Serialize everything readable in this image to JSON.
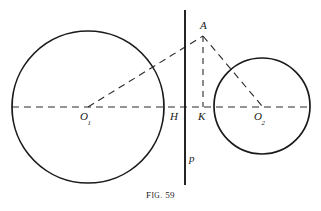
{
  "figure": {
    "caption_prefix": "F",
    "caption_smallcaps": "IG.",
    "caption_number": "59",
    "caption_full": "Fig. 59",
    "background_color": "#ffffff",
    "ink_color": "#1a1a1a"
  },
  "labels": {
    "point_a": "A",
    "point_h": "H",
    "point_k": "K",
    "center_left_base": "O",
    "center_left_sub": "1",
    "center_right_base": "O",
    "center_right_sub": "2",
    "line_p": "p"
  },
  "geometry": {
    "canvas": {
      "width": 321,
      "height": 211
    },
    "circle_left": {
      "cx": 88,
      "cy": 107,
      "r": 76,
      "stroke": "#1a1a1a",
      "stroke_width": 1.6
    },
    "circle_right": {
      "cx": 262,
      "cy": 106,
      "r": 48,
      "stroke": "#1a1a1a",
      "stroke_width": 1.6
    },
    "axis_horizontal": {
      "x1": 12,
      "y1": 107,
      "x2": 311,
      "y2": 107,
      "dash": "7,5"
    },
    "line_p": {
      "x1": 185,
      "y1": 10,
      "x2": 185,
      "y2": 185,
      "stroke_width": 1.8
    },
    "point_a": {
      "x": 203,
      "y": 36
    },
    "point_h": {
      "x": 185,
      "y": 107
    },
    "point_k": {
      "x": 203,
      "y": 107
    },
    "segment_o1_a": {
      "x1": 88,
      "y1": 107,
      "x2": 203,
      "y2": 36,
      "dash": "7,5"
    },
    "segment_a_k": {
      "x1": 203,
      "y1": 36,
      "x2": 203,
      "y2": 107,
      "dash": "6,5"
    },
    "segment_a_o2": {
      "x1": 203,
      "y1": 36,
      "x2": 262,
      "y2": 106,
      "dash": "7,5"
    }
  },
  "label_positions": {
    "a": {
      "left": 200,
      "top": 20
    },
    "h": {
      "left": 170,
      "top": 112
    },
    "k": {
      "left": 198,
      "top": 112
    },
    "o1": {
      "left": 80,
      "top": 112
    },
    "o2": {
      "left": 254,
      "top": 112
    },
    "p": {
      "left": 189,
      "top": 154
    },
    "caption": {
      "top": 190
    }
  }
}
